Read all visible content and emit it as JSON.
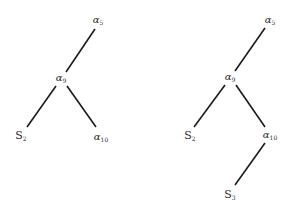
{
  "diagram": {
    "type": "tree",
    "colors": {
      "edge": "#1a1a1a",
      "text": "#2a2a2a",
      "background": "#ffffff"
    },
    "trees": [
      {
        "name": "left-tree",
        "nodes": [
          {
            "id": "L1",
            "base": "α",
            "sub": "5",
            "x": 98,
            "y": 20
          },
          {
            "id": "L2",
            "base": "α",
            "sub": "9",
            "x": 61,
            "y": 78
          },
          {
            "id": "L3",
            "base": "S",
            "sub": "2",
            "x": 21,
            "y": 136
          },
          {
            "id": "L4",
            "base": "α",
            "sub": "10",
            "x": 101,
            "y": 137
          }
        ],
        "edges": [
          [
            "L1",
            "L2"
          ],
          [
            "L2",
            "L3"
          ],
          [
            "L2",
            "L4"
          ]
        ]
      },
      {
        "name": "right-tree",
        "nodes": [
          {
            "id": "R1",
            "base": "α",
            "sub": "5",
            "x": 270,
            "y": 20
          },
          {
            "id": "R2",
            "base": "α",
            "sub": "9",
            "x": 230,
            "y": 77
          },
          {
            "id": "R3",
            "base": "S",
            "sub": "2",
            "x": 190,
            "y": 136
          },
          {
            "id": "R4",
            "base": "α",
            "sub": "10",
            "x": 270,
            "y": 135
          },
          {
            "id": "R5",
            "base": "S",
            "sub": "3",
            "x": 230,
            "y": 195
          }
        ],
        "edges": [
          [
            "R1",
            "R2"
          ],
          [
            "R2",
            "R3"
          ],
          [
            "R2",
            "R4"
          ],
          [
            "R4",
            "R5"
          ]
        ]
      }
    ]
  }
}
